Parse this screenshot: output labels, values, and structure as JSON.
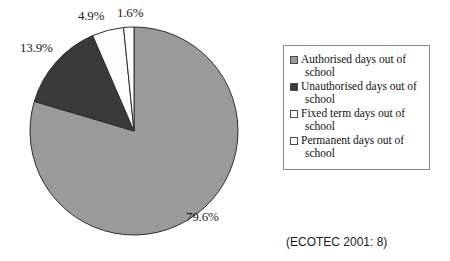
{
  "chart_data": {
    "type": "pie",
    "title": "",
    "labels": [
      "Authorised days out of school",
      "Unauthorised days out of school",
      "Fixed term days out of school",
      "Permanent days out of school"
    ],
    "values": [
      79.6,
      13.9,
      4.9,
      1.6
    ],
    "value_labels": [
      "79.6%",
      "13.9%",
      "4.9%",
      "1.6%"
    ],
    "colors": [
      "#9a9a9a",
      "#3a3a3a",
      "#fdfdfd",
      "#fdfdfd"
    ],
    "slice_border_color": "#2e2e2e",
    "units": "percent",
    "start_angle_deg": 0,
    "direction": "clockwise",
    "legend_position": "right",
    "grid": false
  },
  "legend": {
    "items": [
      {
        "label": "Authorised days out of school",
        "color": "#9a9a9a"
      },
      {
        "label": "Unauthorised days out of school",
        "color": "#3a3a3a"
      },
      {
        "label": "Fixed term days out of school",
        "color": "#fdfdfd"
      },
      {
        "label": "Permanent days out of school",
        "color": "#fdfdfd"
      }
    ]
  },
  "citation": {
    "text": "(ECOTEC 2001: 8)"
  }
}
